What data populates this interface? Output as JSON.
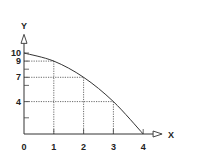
{
  "chart_data": {
    "type": "line",
    "title": "",
    "xlabel": "X",
    "ylabel": "Y",
    "xlim": [
      0,
      4.6
    ],
    "ylim": [
      0,
      12.3
    ],
    "x_ticks": [
      0,
      1,
      2,
      3,
      4
    ],
    "x_tick_labels": [
      "0",
      "1",
      "2",
      "3",
      "4"
    ],
    "y_ticks": [
      2,
      4,
      6,
      7,
      8,
      9,
      10
    ],
    "y_tick_labels": [
      {
        "value": 10,
        "label": "10"
      },
      {
        "value": 9,
        "label": "9"
      },
      {
        "value": 7,
        "label": "7"
      },
      {
        "value": 4,
        "label": "4"
      }
    ],
    "origin_label": "0",
    "grid": false,
    "series": [
      {
        "name": "curve",
        "x": [
          0,
          1,
          2,
          3,
          4
        ],
        "y": [
          10,
          9,
          7,
          4,
          0
        ]
      }
    ],
    "guides": [
      {
        "x": 1,
        "y": 9
      },
      {
        "x": 2,
        "y": 7
      },
      {
        "x": 3,
        "y": 4
      }
    ]
  }
}
